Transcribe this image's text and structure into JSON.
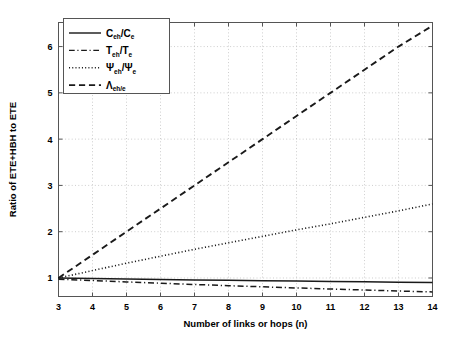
{
  "chart_data": {
    "type": "line",
    "title": "",
    "xlabel": "Number of links or hops (n)",
    "ylabel": "Ratio of ETE+HBH to ETE",
    "xlim": [
      3,
      14
    ],
    "ylim": [
      0.6,
      6.52
    ],
    "xticks": [
      3,
      4,
      5,
      6,
      7,
      8,
      9,
      10,
      11,
      12,
      13,
      14
    ],
    "yticks": [
      1,
      2,
      3,
      4,
      5,
      6
    ],
    "xtick_labels": [
      "3",
      "4",
      "5",
      "6",
      "7",
      "8",
      "9",
      "10",
      "11",
      "12",
      "13",
      "14"
    ],
    "ytick_labels": [
      "1",
      "2",
      "3",
      "4",
      "5",
      "6"
    ],
    "grid": true,
    "grid_style": "dotted",
    "legend_position": "top-left",
    "x": [
      3,
      4,
      5,
      6,
      7,
      8,
      9,
      10,
      11,
      12,
      13,
      14
    ],
    "series": [
      {
        "name": "C_eh/C_e",
        "legend_main": "C",
        "legend_sub": "eh",
        "legend_main2": "/C",
        "legend_sub2": "e",
        "style": "solid",
        "color": "#1a1a1a",
        "values": [
          1.0,
          0.989,
          0.979,
          0.969,
          0.959,
          0.95,
          0.941,
          0.933,
          0.925,
          0.917,
          0.91,
          0.903
        ]
      },
      {
        "name": "T_eh/T_e",
        "legend_main": "T",
        "legend_sub": "eh",
        "legend_main2": "/T",
        "legend_sub2": "e",
        "style": "dashdot",
        "color": "#1a1a1a",
        "values": [
          0.975,
          0.945,
          0.915,
          0.887,
          0.86,
          0.834,
          0.809,
          0.785,
          0.762,
          0.74,
          0.719,
          0.699
        ]
      },
      {
        "name": "Psi_eh/Psi_e",
        "legend_main": "Ψ",
        "legend_sub": "eh",
        "legend_main2": "/Ψ",
        "legend_sub2": "e",
        "style": "dotted",
        "color": "#1a1a1a",
        "values": [
          1.0,
          1.16,
          1.32,
          1.47,
          1.62,
          1.76,
          1.9,
          2.04,
          2.17,
          2.31,
          2.45,
          2.6
        ]
      },
      {
        "name": "Lambda_eh/e",
        "legend_main": "Λ",
        "legend_sub": "eh/e",
        "legend_main2": "",
        "legend_sub2": "",
        "style": "dashed",
        "color": "#1a1a1a",
        "values": [
          1.0,
          1.5,
          2.0,
          2.5,
          3.0,
          3.5,
          4.0,
          4.5,
          5.0,
          5.5,
          6.0,
          6.45
        ]
      }
    ]
  },
  "colors": {
    "background": "#ffffff",
    "axis": "#555555",
    "grid": "#b9b9b9",
    "line": "#1a1a1a"
  }
}
